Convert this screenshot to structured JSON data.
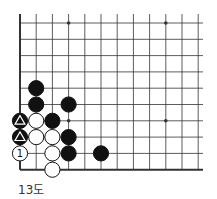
{
  "diagram": {
    "type": "go-board-fragment",
    "caption": "13도",
    "grid": {
      "cols": 12,
      "rows": 10,
      "origin_x": 20,
      "origin_y": 23,
      "spacing_x": 16.2,
      "spacing_y": 16.3,
      "line_top": 14,
      "line_right": 203
    },
    "edges": [
      "left",
      "bottom"
    ],
    "star_points": [
      [
        3,
        0
      ],
      [
        9,
        0
      ],
      [
        3,
        6
      ],
      [
        9,
        6
      ]
    ],
    "stones": [
      {
        "color": "black",
        "col": 1,
        "row": 4
      },
      {
        "color": "black",
        "col": 1,
        "row": 5
      },
      {
        "color": "black",
        "col": 3,
        "row": 5
      },
      {
        "color": "black",
        "col": 0,
        "row": 6,
        "mark": "triangle"
      },
      {
        "color": "white",
        "col": 1,
        "row": 6
      },
      {
        "color": "black",
        "col": 2,
        "row": 6
      },
      {
        "color": "black",
        "col": 0,
        "row": 7,
        "mark": "triangle"
      },
      {
        "color": "white",
        "col": 1,
        "row": 7
      },
      {
        "color": "white",
        "col": 2,
        "row": 7
      },
      {
        "color": "black",
        "col": 3,
        "row": 7
      },
      {
        "color": "white",
        "col": 0,
        "row": 8,
        "mark": "1"
      },
      {
        "color": "white",
        "col": 2,
        "row": 8
      },
      {
        "color": "black",
        "col": 3,
        "row": 8
      },
      {
        "color": "black",
        "col": 5,
        "row": 8
      },
      {
        "color": "white",
        "col": 2,
        "row": 9
      }
    ],
    "colors": {
      "line": "#333333",
      "edge": "#111111",
      "black_stone": "#111111",
      "white_stone": "#ffffff",
      "mark_on_black": "#ffffff",
      "mark_on_white": "#111111"
    }
  }
}
